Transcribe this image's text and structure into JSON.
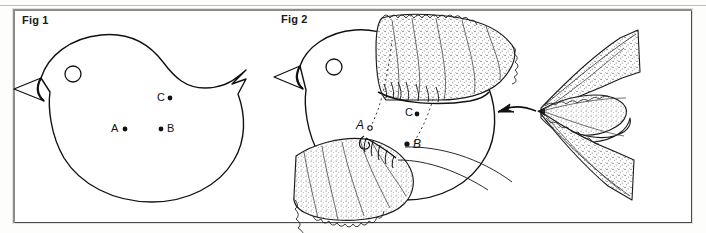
{
  "page": {
    "background_color": "#ffffff",
    "ink_color": "#111111",
    "frame_color": "#4a4a4a"
  },
  "figures": [
    {
      "id": "fig1",
      "label": "Fig 1",
      "caption_position": "top-left",
      "description": "Plain bird body outline pattern with beak, eye circle and notched tail",
      "markers": [
        {
          "name": "A",
          "label": "A",
          "label_side": "left",
          "x": 118,
          "y": 128
        },
        {
          "name": "B",
          "label": "B",
          "label_side": "right",
          "x": 168,
          "y": 128
        },
        {
          "name": "C",
          "label": "C",
          "label_side": "right",
          "x": 168,
          "y": 97
        }
      ],
      "eye": {
        "label": "eye",
        "x": 73,
        "y": 74,
        "r": 8
      }
    },
    {
      "id": "fig2",
      "label": "Fig 2",
      "caption_position": "top-left",
      "description": "Same bird with gathered lace wings attached, dotted guide lines from points A and B to the gathered edges",
      "markers": [
        {
          "name": "A",
          "label": "A",
          "label_side": "left",
          "x": 368,
          "y": 128
        },
        {
          "name": "B",
          "label": "B",
          "label_side": "right",
          "x": 412,
          "y": 144
        },
        {
          "name": "C",
          "label": "C",
          "label_side": "right",
          "x": 418,
          "y": 113
        }
      ],
      "eye": {
        "label": "eye",
        "x": 334,
        "y": 67,
        "r": 8
      },
      "parts": [
        {
          "name": "upper-gathered-lace-wing"
        },
        {
          "name": "lower-gathered-lace-wing"
        },
        {
          "name": "guide-line-a"
        },
        {
          "name": "guide-line-b"
        },
        {
          "name": "arrow-to-tail"
        }
      ]
    },
    {
      "id": "detail",
      "label": "",
      "description": "Detail of gathered ribbon / lace tail fanned from a single gather point",
      "parts": [
        {
          "name": "gathered-ribbon-detail"
        }
      ]
    }
  ]
}
